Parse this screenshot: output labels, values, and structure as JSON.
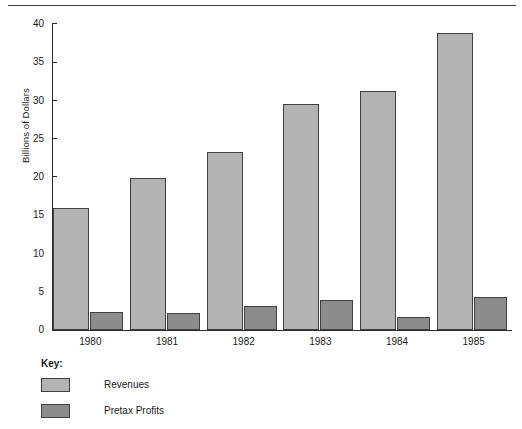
{
  "chart_data": {
    "type": "bar",
    "title": "",
    "xlabel": "",
    "ylabel": "Billions of Dollars",
    "categories": [
      "1980",
      "1981",
      "1982",
      "1983",
      "1984",
      "1985"
    ],
    "series": [
      {
        "name": "Revenues",
        "color": "#b3b3b3",
        "values": [
          16.0,
          19.9,
          23.3,
          29.5,
          31.3,
          38.8
        ]
      },
      {
        "name": "Pretax Profits",
        "color": "#8c8c8c",
        "values": [
          2.3,
          2.2,
          3.1,
          3.9,
          1.7,
          4.3
        ]
      }
    ],
    "ylim": [
      0,
      40
    ],
    "yticks": [
      "0",
      "5",
      "10",
      "15",
      "20",
      "25",
      "30",
      "35",
      "40"
    ],
    "ytick_values": [
      0,
      5,
      10,
      15,
      20,
      25,
      30,
      35,
      40
    ],
    "grid": false,
    "legend_position": "below-axes-left"
  },
  "legend": {
    "title": "Key:",
    "entries": [
      {
        "label": "Revenues",
        "color": "#b3b3b3"
      },
      {
        "label": "Pretax Profits",
        "color": "#8c8c8c"
      }
    ]
  }
}
